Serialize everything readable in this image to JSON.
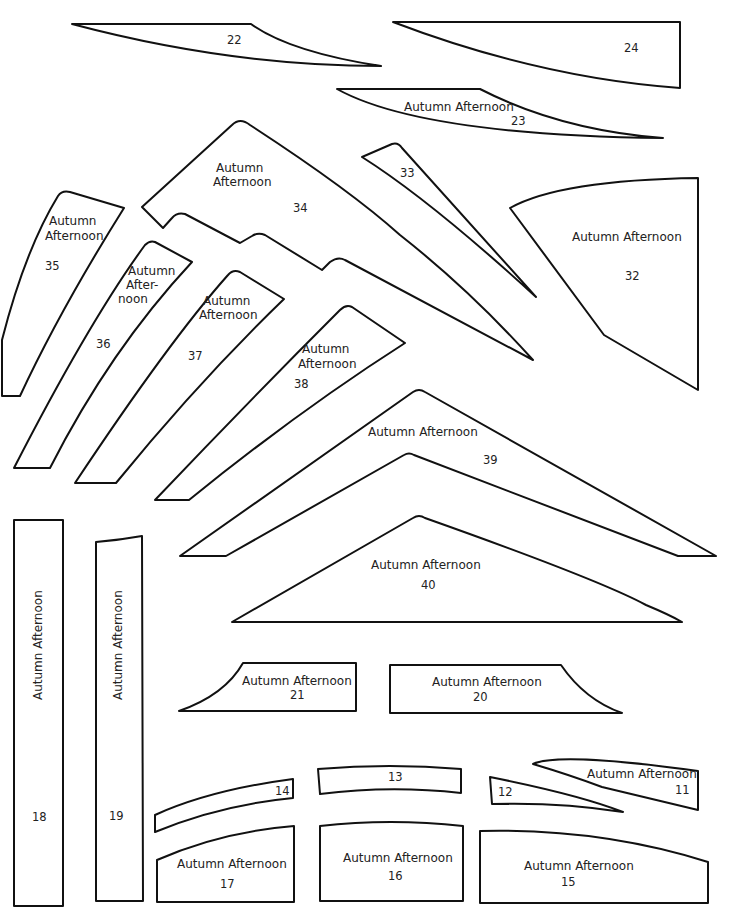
{
  "sheet": {
    "label": "Autumn Afternoon",
    "stroke_color": "#111111",
    "background": "#ffffff"
  },
  "pieces": {
    "p11": {
      "number": "11",
      "label": "Autumn Afternoon"
    },
    "p12": {
      "number": "12"
    },
    "p13": {
      "number": "13"
    },
    "p14": {
      "number": "14"
    },
    "p15": {
      "number": "15",
      "label": "Autumn Afternoon"
    },
    "p16": {
      "number": "16",
      "label": "Autumn Afternoon"
    },
    "p17": {
      "number": "17",
      "label": "Autumn Afternoon"
    },
    "p18": {
      "number": "18",
      "label": "Autumn Afternoon"
    },
    "p19": {
      "number": "19",
      "label": "Autumn Afternoon"
    },
    "p20": {
      "number": "20",
      "label": "Autumn Afternoon"
    },
    "p21": {
      "number": "21",
      "label": "Autumn Afternoon"
    },
    "p22": {
      "number": "22"
    },
    "p23": {
      "number": "23",
      "label": "Autumn Afternoon"
    },
    "p24": {
      "number": "24"
    },
    "p32": {
      "number": "32",
      "label": "Autumn Afternoon"
    },
    "p33": {
      "number": "33"
    },
    "p34": {
      "number": "34",
      "label_line1": "Autumn",
      "label_line2": "Afternoon"
    },
    "p35": {
      "number": "35",
      "label_line1": "Autumn",
      "label_line2": "Afternoon"
    },
    "p36": {
      "number": "36",
      "label_line1": "Autumn",
      "label_line2": "After-",
      "label_line3": "noon"
    },
    "p37": {
      "number": "37",
      "label_line1": "Autumn",
      "label_line2": "Afternoon"
    },
    "p38": {
      "number": "38",
      "label_line1": "Autumn",
      "label_line2": "Afternoon"
    },
    "p39": {
      "number": "39",
      "label": "Autumn Afternoon"
    },
    "p40": {
      "number": "40",
      "label": "Autumn Afternoon"
    }
  }
}
